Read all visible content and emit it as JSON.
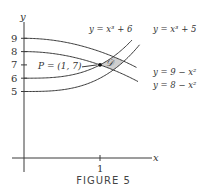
{
  "caption": "FIGURE 5",
  "chart_data": {
    "type": "line",
    "title": "",
    "xlabel": "x",
    "ylabel": "y",
    "x_ticks": [
      {
        "value": 1,
        "label": "1"
      }
    ],
    "y_ticks": [
      {
        "value": 5,
        "label": "5"
      },
      {
        "value": 6,
        "label": "6"
      },
      {
        "value": 7,
        "label": "7"
      },
      {
        "value": 8,
        "label": "8"
      },
      {
        "value": 9,
        "label": "9"
      }
    ],
    "xlim": [
      -0.25,
      1.7
    ],
    "ylim": [
      0,
      11
    ],
    "grid": false,
    "series": [
      {
        "name": "y = x^3 + 6",
        "formula": "x^3+6",
        "label_text": "y = x³ + 6",
        "label_position": "top"
      },
      {
        "name": "y = x^3 + 5",
        "formula": "x^3+5",
        "label_text": "y = x³ + 5",
        "label_position": "top-right"
      },
      {
        "name": "y = 9 - x^2",
        "formula": "9-x^2",
        "label_text": "y = 9 − x²",
        "label_position": "right"
      },
      {
        "name": "y = 8 - x^2",
        "formula": "8-x^2",
        "label_text": "y = 8 − x²",
        "label_position": "right"
      }
    ],
    "annotations": [
      {
        "type": "point",
        "x": 1,
        "y": 7,
        "label": "P = (1, 7)"
      },
      {
        "type": "region",
        "label": "𝒟",
        "description": "shaded region bounded by the four curves near P",
        "fill": "#cfcfcf"
      }
    ]
  }
}
